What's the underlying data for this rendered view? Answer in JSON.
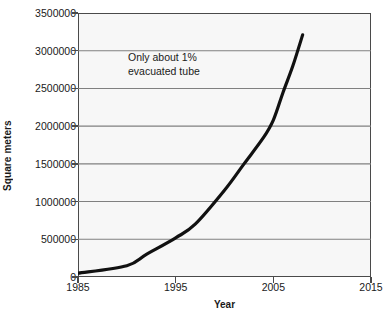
{
  "figure": {
    "title_cropped": "",
    "background_color": "#ffffff",
    "plot_background_color": "#f7f7f7",
    "gridline_color": "#808080",
    "axis_color": "#4a4a4a",
    "line_color": "#111111"
  },
  "axes": {
    "y_title": "Square meters",
    "x_title": "Year"
  },
  "annotations": [
    {
      "line1": "Only about 1%",
      "line2": "evacuated tube"
    }
  ],
  "chart_data": {
    "type": "line",
    "title": "",
    "xlabel": "Year",
    "ylabel": "Square meters",
    "xlim": [
      1985,
      2015
    ],
    "ylim": [
      0,
      3500000
    ],
    "grid": true,
    "legend": null,
    "x_ticks": [
      1985,
      1995,
      2005,
      2015
    ],
    "x_tick_labels": [
      "1985",
      "1995",
      "2005",
      "2015"
    ],
    "y_ticks": [
      0,
      500000,
      1000000,
      1500000,
      2000000,
      2500000,
      3000000,
      3500000
    ],
    "y_tick_labels": [
      "0",
      "500000",
      "1000000",
      "1500000",
      "2000000",
      "2500000",
      "3000000",
      "3500000"
    ],
    "annotations": [
      "Only about 1% evacuated tube"
    ],
    "series": [
      {
        "name": "Solar thermal collector area installed",
        "x": [
          1985,
          1990,
          1992,
          1995,
          1997,
          2000,
          2002,
          2004,
          2005,
          2006,
          2007,
          2008
        ],
        "y": [
          50000,
          150000,
          300000,
          520000,
          700000,
          1150000,
          1500000,
          1850000,
          2080000,
          2450000,
          2800000,
          3210000
        ]
      }
    ]
  }
}
